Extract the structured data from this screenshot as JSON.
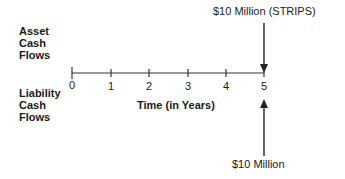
{
  "diagram": {
    "type": "cash-flow-timeline",
    "asset_label": [
      "Asset",
      "Cash",
      "Flows"
    ],
    "liability_label": [
      "Liability",
      "Cash",
      "Flows"
    ],
    "axis_title": "Time (in Years)",
    "ticks": [
      "0",
      "1",
      "2",
      "3",
      "4",
      "5"
    ],
    "asset_flow": {
      "time": 5,
      "label": "$10 Million (STRIPS)",
      "direction": "inflow"
    },
    "liability_flow": {
      "time": 5,
      "label": "$10 Million",
      "direction": "outflow"
    }
  }
}
